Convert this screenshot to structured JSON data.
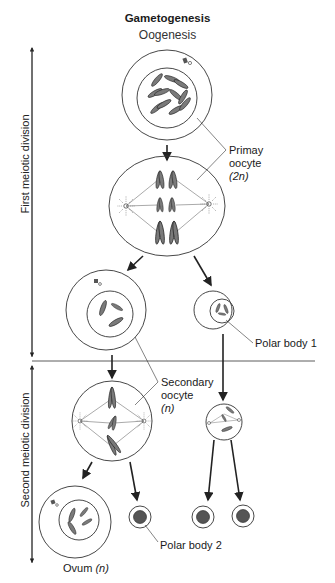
{
  "diagram": {
    "title": "Gametogenesis",
    "subtitle": "Oogenesis",
    "phases": {
      "first": "First meiotic division",
      "second": "Second meiotic division"
    },
    "labels": {
      "primary_oocyte": "Primay",
      "primary_oocyte_2": "oocyte",
      "primary_ploidy": "(2n)",
      "polar_body_1": "Polar body 1",
      "secondary_oocyte": "Secondary",
      "secondary_oocyte_2": "oocyte",
      "secondary_ploidy": "(n)",
      "polar_body_2": "Polar body 2",
      "ovum": "Ovum",
      "ovum_ploidy": "(n)"
    },
    "colors": {
      "line": "#333333",
      "chromosome_fill": "#7a7a7a",
      "background": "#ffffff"
    }
  }
}
